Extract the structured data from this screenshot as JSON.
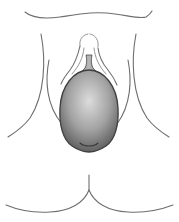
{
  "figure": {
    "type": "anatomical line illustration",
    "description": "Frontal lower-torso outline with a shaded oval mass (swelling) at center",
    "colors": {
      "background": "#ffffff",
      "outline": "#6e6e6e",
      "mass_light": "#d8d8d8",
      "mass_mid": "#9a9a9a",
      "mass_dark": "#4a4a4a"
    },
    "labels": []
  }
}
